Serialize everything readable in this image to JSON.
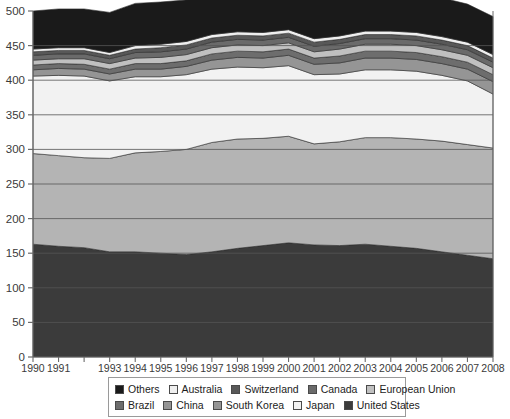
{
  "chart_data": {
    "type": "area",
    "stacked": true,
    "title": "",
    "subtitle": "",
    "xlabel": "",
    "ylabel": "",
    "xlim": [
      1990,
      2008
    ],
    "ylim": [
      0,
      500
    ],
    "ytick_step": 50,
    "grid": true,
    "legend_position": "bottom",
    "x": [
      1990,
      1991,
      1992,
      1993,
      1994,
      1995,
      1996,
      1997,
      1998,
      1999,
      2000,
      2001,
      2002,
      2003,
      2004,
      2005,
      2006,
      2007,
      2008
    ],
    "xtick_labels": [
      "1990",
      "1991",
      "",
      "1993",
      "1994",
      "1995",
      "1996",
      "1997",
      "1998",
      "1999",
      "2000",
      "2001",
      "2002",
      "2003",
      "2004",
      "2005",
      "2006",
      "2007",
      "2008"
    ],
    "ytick_labels": [
      "0",
      "50",
      "100",
      "150",
      "200",
      "250",
      "300",
      "350",
      "400",
      "450",
      "500"
    ],
    "stack_order_bottom_to_top": [
      "United States",
      "Japan",
      "South Korea",
      "China",
      "Brazil",
      "European Union",
      "Canada",
      "Switzerland",
      "Australia",
      "Others"
    ],
    "series": [
      {
        "name": "United States",
        "color": "#3b3b3b",
        "values": [
          163,
          160,
          158,
          152,
          152,
          150,
          148,
          152,
          157,
          161,
          165,
          162,
          161,
          163,
          160,
          157,
          152,
          147,
          142
        ]
      },
      {
        "name": "Japan",
        "color": "#b4b4b4",
        "values": [
          131,
          131,
          130,
          135,
          143,
          147,
          152,
          158,
          158,
          155,
          154,
          146,
          150,
          154,
          157,
          158,
          160,
          160,
          160
        ]
      },
      {
        "name": "South Korea",
        "color": "#f2f2f2",
        "values": [
          112,
          116,
          118,
          112,
          110,
          108,
          108,
          106,
          104,
          102,
          102,
          100,
          98,
          98,
          98,
          98,
          95,
          92,
          78
        ]
      },
      {
        "name": "China",
        "color": "#959595",
        "values": [
          9,
          10,
          10,
          10,
          11,
          11,
          12,
          13,
          14,
          14,
          15,
          15,
          16,
          17,
          17,
          17,
          17,
          17,
          18
        ]
      },
      {
        "name": "Brazil",
        "color": "#6d6d6d",
        "values": [
          7,
          7,
          7,
          7,
          8,
          8,
          8,
          9,
          9,
          9,
          9,
          9,
          10,
          10,
          10,
          10,
          10,
          10,
          10
        ]
      },
      {
        "name": "European Union",
        "color": "#c0c0c0",
        "values": [
          7,
          7,
          8,
          8,
          8,
          9,
          9,
          9,
          9,
          9,
          9,
          9,
          10,
          10,
          10,
          10,
          10,
          10,
          10
        ]
      },
      {
        "name": "Canada",
        "color": "#6a6a6a",
        "values": [
          7,
          7,
          7,
          7,
          8,
          8,
          8,
          8,
          8,
          8,
          8,
          8,
          8,
          8,
          8,
          8,
          8,
          8,
          8
        ]
      },
      {
        "name": "Switzerland",
        "color": "#585858",
        "values": [
          5,
          5,
          5,
          5,
          5,
          6,
          6,
          6,
          6,
          6,
          6,
          6,
          6,
          6,
          6,
          6,
          6,
          6,
          6
        ]
      },
      {
        "name": "Australia",
        "color": "#efefef",
        "values": [
          4,
          4,
          4,
          4,
          5,
          5,
          5,
          5,
          5,
          5,
          5,
          5,
          5,
          5,
          5,
          5,
          5,
          5,
          5
        ]
      },
      {
        "name": "Others",
        "color": "#1a1a1a",
        "values": [
          55,
          56,
          56,
          58,
          61,
          61,
          60,
          59,
          58,
          58,
          57,
          57,
          57,
          57,
          57,
          57,
          56,
          55,
          55
        ]
      }
    ]
  },
  "legend": {
    "rows": [
      [
        {
          "label": "Others",
          "color": "#1a1a1a"
        },
        {
          "label": "Australia",
          "color": "#efefef"
        },
        {
          "label": "Switzerland",
          "color": "#585858"
        },
        {
          "label": "Canada",
          "color": "#6a6a6a"
        },
        {
          "label": "European Union",
          "color": "#c0c0c0"
        }
      ],
      [
        {
          "label": "Brazil",
          "color": "#6d6d6d"
        },
        {
          "label": "China",
          "color": "#959595"
        },
        {
          "label": "South Korea",
          "color": "#959595"
        },
        {
          "label": "Japan",
          "color": "#f2f2f2"
        },
        {
          "label": "United States",
          "color": "#3b3b3b"
        }
      ]
    ]
  },
  "axis": {
    "y_min_label": "0",
    "y_max_label": "500"
  }
}
